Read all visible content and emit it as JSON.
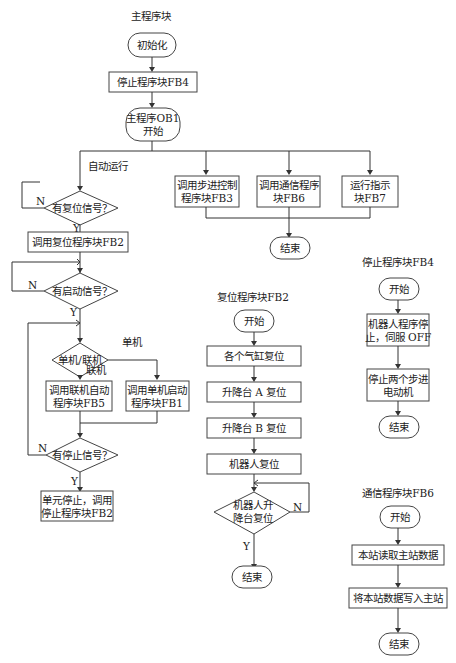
{
  "main": {
    "title": "主程序块",
    "init": "初始化",
    "stop_fb4": "停止程序块FB4",
    "ob1_line1": "主程序OB1",
    "ob1_line2": "开始",
    "auto_run": "自动运行",
    "fb3_line1": "调用步进控制",
    "fb3_line2": "程序块FB3",
    "fb6_line1": "调用通信程序",
    "fb6_line2": "块FB6",
    "fb7_line1": "运行指示",
    "fb7_line2": "块FB7",
    "end": "结束",
    "reset_q": "有复位信号？",
    "call_fb2": "调用复位程序块FB2",
    "start_q": "有启动信号？",
    "mode_q": "单机/联机",
    "single": "单机",
    "online": "联机",
    "fb5_line1": "调用联机自动",
    "fb5_line2": "程序块FB5",
    "fb1_line1": "调用单机启动",
    "fb1_line2": "程序块FB1",
    "stop_q": "有停止信号？",
    "unit_stop_line1": "单元停止，调用",
    "unit_stop_line2": "停止程序块FB2",
    "yes": "Y",
    "no": "N"
  },
  "fb2": {
    "title": "复位程序块FB2",
    "start": "开始",
    "step1": "各个气缸复位",
    "step2": "升降台 A 复位",
    "step3": "升降台 B 复位",
    "step4": "机器人复位",
    "q_line1": "机器人升",
    "q_line2": "降台复位",
    "end": "结束",
    "yes": "Y",
    "no": "N"
  },
  "fb4": {
    "title": "停止程序块FB4",
    "start": "开始",
    "step1_line1": "机器人程序停",
    "step1_line2": "止，伺服 OFF",
    "step2_line1": "停止两个步进",
    "step2_line2": "电动机",
    "end": "结束"
  },
  "fb6": {
    "title": "通信程序块FB6",
    "start": "开始",
    "step1": "本站读取主站数据",
    "step2": "将本站数据写入主站",
    "end": "结束"
  }
}
